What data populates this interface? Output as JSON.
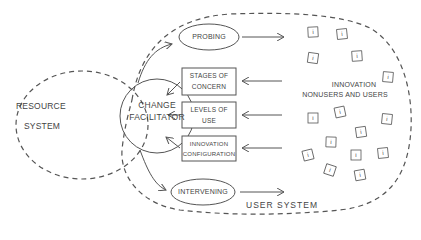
{
  "diagram": {
    "resource_system": {
      "line1": "RESOURCE",
      "line2": "SYSTEM"
    },
    "change_facilitator": {
      "line1": "CHANGE",
      "line2": "FACILITATOR"
    },
    "user_system": {
      "label": "USER SYSTEM"
    },
    "probing": {
      "label": "PROBING"
    },
    "intervening": {
      "label": "INTERVENING"
    },
    "stages_of_concern": {
      "line1": "STAGES OF",
      "line2": "CONCERN"
    },
    "levels_of_use": {
      "line1": "LEVELS OF",
      "line2": "USE"
    },
    "innovation_configuration": {
      "line1": "INNOVATION",
      "line2": "CONFIGURATION"
    },
    "innovation_users": {
      "line1": "INNOVATION",
      "line2": "NONUSERS AND USERS"
    },
    "user_symbol": "i",
    "user_symbol_count": 15
  }
}
